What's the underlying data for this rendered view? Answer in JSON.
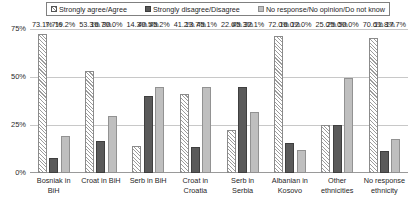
{
  "chart_data": {
    "type": "bar",
    "title": "",
    "xlabel": "",
    "ylabel": "",
    "ylim": [
      0,
      75
    ],
    "grid": true,
    "legend_position": "top",
    "ytick_labels": [
      "0%",
      "25%",
      "50%",
      "75%"
    ],
    "ytick_values": [
      0,
      25,
      50,
      75
    ],
    "categories": [
      "Bosniak in BiH",
      "Croat in BiH",
      "Serb in BiH",
      "Croat in Croatia",
      "Serb in Serbia",
      "Albanian in Kosovo",
      "Other ethnicities",
      "No response ethnicity"
    ],
    "category_lines": [
      [
        "Bosniak in",
        "BiH"
      ],
      [
        "Croat in BiH",
        ""
      ],
      [
        "Serb in BiH",
        ""
      ],
      [
        "Croat in",
        "Croatia"
      ],
      [
        "Serb in",
        "Serbia"
      ],
      [
        "Albanian in",
        "Kosovo"
      ],
      [
        "Other",
        "ethnicities"
      ],
      [
        "No response",
        "ethnicity"
      ]
    ],
    "series": [
      {
        "name": "Strongly agree/Agree",
        "pattern": "diagonal-hatch",
        "color": "#ffffff",
        "values": [
          73.1,
          53.3,
          14.3,
          41.2,
          22.6,
          72.0,
          25.0,
          70.6
        ],
        "labels": [
          "73.1%",
          "53.3%",
          "14.3%",
          "41.2%",
          "22.6%",
          "72.0%",
          "25.0%",
          "70.6%"
        ]
      },
      {
        "name": "Strongly disagree/Disagree",
        "pattern": "solid",
        "color": "#5a5a5a",
        "values": [
          7.7,
          16.7,
          40.5,
          13.7,
          45.3,
          16.0,
          25.0,
          11.8
        ],
        "labels": [
          "7.7%",
          "16.7%",
          "40.5%",
          "13.7%",
          "45.3%",
          "16.0%",
          "25.0%",
          "11.8%"
        ]
      },
      {
        "name": "No response/No opinion/Do not know",
        "pattern": "solid",
        "color": "#bfbfbf",
        "values": [
          19.2,
          30.0,
          45.2,
          45.1,
          32.1,
          12.0,
          50.0,
          17.7
        ],
        "labels": [
          "19.2%",
          "30.0%",
          "45.2%",
          "45.1%",
          "32.1%",
          "12.0%",
          "50.0%",
          "17.7%"
        ]
      }
    ]
  },
  "legend": {
    "items": [
      {
        "label": "Strongly agree/Agree",
        "swatch": "hatch-swatch"
      },
      {
        "label": "Strongly disagree/Disagree",
        "swatch": "dark-swatch"
      },
      {
        "label": "No response/No opinion/Do not know",
        "swatch": "light-swatch"
      }
    ]
  }
}
